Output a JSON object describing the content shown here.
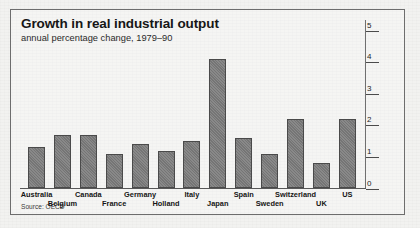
{
  "figure": {
    "title": "Growth in real industrial output",
    "subtitle": "annual percentage change, 1979–90",
    "source": "Source: OECD"
  },
  "chart_data": {
    "type": "bar",
    "title": "Growth in real industrial output",
    "subtitle": "annual percentage change, 1979–90",
    "xlabel": "",
    "ylabel": "annual percentage change",
    "ylim": [
      0,
      5
    ],
    "yticks": [
      0,
      1,
      2,
      3,
      4,
      5
    ],
    "ytick_labels": [
      "0",
      "1",
      "2",
      "3",
      "4",
      "5"
    ],
    "y_axis_position": "right",
    "grid": false,
    "legend": null,
    "source": "Source: OECD",
    "bar_color": "#7c7c7c",
    "categories": [
      "Australia",
      "Belgium",
      "Canada",
      "France",
      "Germany",
      "Holland",
      "Italy",
      "Japan",
      "Spain",
      "Sweden",
      "Switzerland",
      "UK",
      "US"
    ],
    "values": [
      1.3,
      1.7,
      1.7,
      1.1,
      1.4,
      1.2,
      1.5,
      4.1,
      1.6,
      1.1,
      2.2,
      0.8,
      2.2
    ],
    "label_rows": [
      0,
      1,
      0,
      1,
      0,
      1,
      0,
      1,
      0,
      1,
      0,
      1,
      0
    ]
  }
}
